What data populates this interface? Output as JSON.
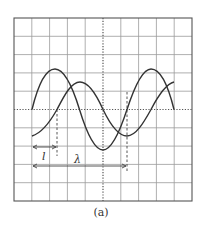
{
  "figure": {
    "caption": "(a)",
    "grid": {
      "x0": 14,
      "y0": 18,
      "x1": 192,
      "y1": 201,
      "cols": 10,
      "rows": 10,
      "line_color": "#9a9a9a",
      "border_color": "#555555"
    },
    "axes": {
      "center_x": 103,
      "center_y": 109.5,
      "style": "dotted"
    },
    "waves": [
      {
        "name": "wave-1",
        "amplitude_px": 40,
        "period_px": 95,
        "start_x": 32,
        "end_x": 174,
        "phase_at_start": "zero-rising"
      },
      {
        "name": "wave-2",
        "amplitude_px": 27,
        "period_px": 95,
        "start_x": 32,
        "end_x": 174,
        "phase_shift_px": 25
      }
    ],
    "markers": [
      {
        "label": "l",
        "from_x": 32,
        "to_x": 57,
        "y": 147
      },
      {
        "label": "λ",
        "from_x": 32,
        "to_x": 127,
        "y": 166
      }
    ]
  }
}
